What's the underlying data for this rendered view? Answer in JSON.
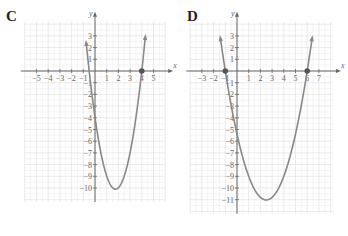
{
  "panels": [
    {
      "label": "C",
      "x_axis_label": "x",
      "y_axis_label": "y",
      "x_ticks": [
        "−5",
        "−4",
        "−3",
        "−2",
        "−1",
        "1",
        "2",
        "3",
        "4",
        "5"
      ],
      "y_ticks": [
        "3",
        "2",
        "1",
        "−1",
        "−2",
        "−3",
        "−4",
        "−5",
        "−6",
        "−7",
        "−8",
        "−9",
        "−10"
      ],
      "marked_points": [
        [
          4,
          0
        ]
      ],
      "vertex": [
        2,
        -10
      ]
    },
    {
      "label": "D",
      "x_axis_label": "x",
      "y_axis_label": "y",
      "x_ticks": [
        "−3",
        "−2",
        "−1",
        "1",
        "2",
        "3",
        "4",
        "5",
        "6",
        "7"
      ],
      "y_ticks": [
        "3",
        "2",
        "1",
        "−1",
        "−2",
        "−3",
        "−4",
        "−5",
        "−6",
        "−7",
        "−8",
        "−9",
        "−10",
        "−11"
      ],
      "marked_points": [
        [
          -1,
          0
        ],
        [
          6,
          0
        ]
      ],
      "vertex": [
        2.5,
        -11
      ]
    }
  ],
  "chart_data": [
    {
      "type": "line",
      "title": "C",
      "xlabel": "x",
      "ylabel": "y",
      "xlim": [
        -6,
        6
      ],
      "ylim": [
        -11,
        4
      ],
      "grid": true,
      "series": [
        {
          "name": "parabola",
          "x": [
            -0.7,
            0,
            1,
            2,
            3,
            4,
            4.3
          ],
          "y": [
            4,
            -4,
            -9,
            -10,
            -8,
            0,
            3.5
          ]
        }
      ],
      "points": [
        {
          "x": 4,
          "y": 0
        }
      ],
      "vertex": {
        "x": 2,
        "y": -10
      }
    },
    {
      "type": "line",
      "title": "D",
      "xlabel": "x",
      "ylabel": "y",
      "xlim": [
        -4,
        8
      ],
      "ylim": [
        -12,
        4
      ],
      "grid": true,
      "series": [
        {
          "name": "parabola",
          "x": [
            -1.4,
            -1,
            0,
            1,
            2.5,
            4,
            5,
            6,
            6.4
          ],
          "y": [
            3.6,
            0,
            -5.4,
            -9,
            -11,
            -9,
            -5.4,
            0,
            3.6
          ]
        }
      ],
      "points": [
        {
          "x": -1,
          "y": 0
        },
        {
          "x": 6,
          "y": 0
        }
      ],
      "vertex": {
        "x": 2.5,
        "y": -11
      }
    }
  ]
}
